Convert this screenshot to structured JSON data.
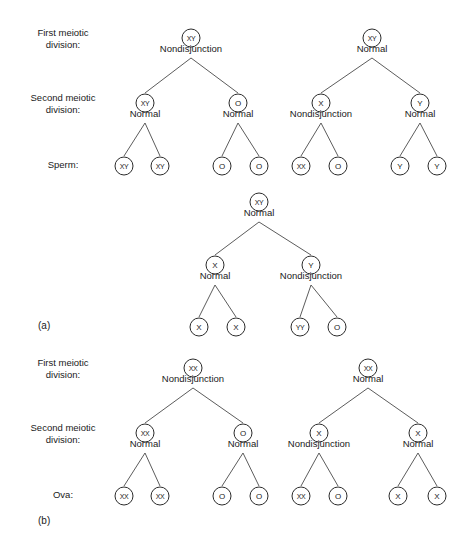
{
  "figure": {
    "background_color": "#ffffff",
    "stroke_color": "#2b2b2b",
    "line_color": "#4a4a4a",
    "text_color": "#1a1a1a",
    "width": 470,
    "height": 557
  },
  "panels": [
    {
      "id": "panel-a",
      "caption": "(a)",
      "caption_x": 38,
      "caption_y": 329,
      "row_labels": [
        {
          "id": "row-label-first-meiotic-a",
          "line1": "First meiotic",
          "line2": "division:",
          "x": 63,
          "y": 36
        },
        {
          "id": "row-label-second-meiotic-a",
          "line1": "Second meiotic",
          "line2": "division:",
          "x": 63,
          "y": 101
        },
        {
          "id": "row-label-gamete-a",
          "line1": "Sperm:",
          "line2": "",
          "x": 63,
          "y": 168
        }
      ],
      "trees": [
        {
          "id": "tree-a-left",
          "root": {
            "id": "node-a-left-root",
            "genotype": "XY",
            "event": "Nondisjunction",
            "x": 191,
            "y": 38,
            "children": [
              {
                "id": "node-a-left-sec-1",
                "genotype": "XY",
                "event": "Normal",
                "x": 145,
                "y": 103,
                "children": [
                  {
                    "id": "node-a-left-sperm-1",
                    "genotype": "XY",
                    "event": "",
                    "x": 124,
                    "y": 166,
                    "children": []
                  },
                  {
                    "id": "node-a-left-sperm-2",
                    "genotype": "XY",
                    "event": "",
                    "x": 160,
                    "y": 166,
                    "children": []
                  }
                ]
              },
              {
                "id": "node-a-left-sec-2",
                "genotype": "O",
                "event": "Normal",
                "x": 238,
                "y": 103,
                "children": [
                  {
                    "id": "node-a-left-sperm-3",
                    "genotype": "O",
                    "event": "",
                    "x": 222,
                    "y": 166,
                    "children": []
                  },
                  {
                    "id": "node-a-left-sperm-4",
                    "genotype": "O",
                    "event": "",
                    "x": 259,
                    "y": 166,
                    "children": []
                  }
                ]
              }
            ]
          }
        },
        {
          "id": "tree-a-right",
          "root": {
            "id": "node-a-right-root",
            "genotype": "XY",
            "event": "Normal",
            "x": 372,
            "y": 38,
            "children": [
              {
                "id": "node-a-right-sec-1",
                "genotype": "X",
                "event": "Nondisjunction",
                "x": 321,
                "y": 103,
                "children": [
                  {
                    "id": "node-a-right-sperm-1",
                    "genotype": "XX",
                    "event": "",
                    "x": 301,
                    "y": 166,
                    "children": []
                  },
                  {
                    "id": "node-a-right-sperm-2",
                    "genotype": "O",
                    "event": "",
                    "x": 338,
                    "y": 166,
                    "children": []
                  }
                ]
              },
              {
                "id": "node-a-right-sec-2",
                "genotype": "Y",
                "event": "Normal",
                "x": 420,
                "y": 103,
                "children": [
                  {
                    "id": "node-a-right-sperm-3",
                    "genotype": "Y",
                    "event": "",
                    "x": 400,
                    "y": 166,
                    "children": []
                  },
                  {
                    "id": "node-a-right-sperm-4",
                    "genotype": "Y",
                    "event": "",
                    "x": 437,
                    "y": 166,
                    "children": []
                  }
                ]
              }
            ]
          }
        },
        {
          "id": "tree-a-middle",
          "root": {
            "id": "node-a-mid-root",
            "genotype": "XY",
            "event": "Normal",
            "x": 259,
            "y": 202,
            "children": [
              {
                "id": "node-a-mid-sec-1",
                "genotype": "X",
                "event": "Normal",
                "x": 215,
                "y": 265,
                "children": [
                  {
                    "id": "node-a-mid-sperm-1",
                    "genotype": "X",
                    "event": "",
                    "x": 199,
                    "y": 327,
                    "children": []
                  },
                  {
                    "id": "node-a-mid-sperm-2",
                    "genotype": "X",
                    "event": "",
                    "x": 236,
                    "y": 327,
                    "children": []
                  }
                ]
              },
              {
                "id": "node-a-mid-sec-2",
                "genotype": "Y",
                "event": "Nondisjunction",
                "x": 311,
                "y": 265,
                "children": [
                  {
                    "id": "node-a-mid-sperm-3",
                    "genotype": "YY",
                    "event": "",
                    "x": 300,
                    "y": 327,
                    "children": []
                  },
                  {
                    "id": "node-a-mid-sperm-4",
                    "genotype": "O",
                    "event": "",
                    "x": 337,
                    "y": 327,
                    "children": []
                  }
                ]
              }
            ]
          }
        }
      ]
    },
    {
      "id": "panel-b",
      "caption": "(b)",
      "caption_x": 38,
      "caption_y": 524,
      "row_labels": [
        {
          "id": "row-label-first-meiotic-b",
          "line1": "First meiotic",
          "line2": "division:",
          "x": 63,
          "y": 366
        },
        {
          "id": "row-label-second-meiotic-b",
          "line1": "Second meiotic",
          "line2": "division:",
          "x": 63,
          "y": 431
        },
        {
          "id": "row-label-gamete-b",
          "line1": "Ova:",
          "line2": "",
          "x": 63,
          "y": 498
        }
      ],
      "trees": [
        {
          "id": "tree-b-left",
          "root": {
            "id": "node-b-left-root",
            "genotype": "XX",
            "event": "Nondisjunction",
            "x": 193,
            "y": 368,
            "children": [
              {
                "id": "node-b-left-sec-1",
                "genotype": "XX",
                "event": "Normal",
                "x": 145,
                "y": 433,
                "children": [
                  {
                    "id": "node-b-left-ova-1",
                    "genotype": "XX",
                    "event": "",
                    "x": 124,
                    "y": 496,
                    "children": []
                  },
                  {
                    "id": "node-b-left-ova-2",
                    "genotype": "XX",
                    "event": "",
                    "x": 160,
                    "y": 496,
                    "children": []
                  }
                ]
              },
              {
                "id": "node-b-left-sec-2",
                "genotype": "O",
                "event": "Normal",
                "x": 243,
                "y": 433,
                "children": [
                  {
                    "id": "node-b-left-ova-3",
                    "genotype": "O",
                    "event": "",
                    "x": 222,
                    "y": 496,
                    "children": []
                  },
                  {
                    "id": "node-b-left-ova-4",
                    "genotype": "O",
                    "event": "",
                    "x": 259,
                    "y": 496,
                    "children": []
                  }
                ]
              }
            ]
          }
        },
        {
          "id": "tree-b-right",
          "root": {
            "id": "node-b-right-root",
            "genotype": "XX",
            "event": "Normal",
            "x": 368,
            "y": 368,
            "children": [
              {
                "id": "node-b-right-sec-1",
                "genotype": "X",
                "event": "Nondisjunction",
                "x": 319,
                "y": 433,
                "children": [
                  {
                    "id": "node-b-right-ova-1",
                    "genotype": "XX",
                    "event": "",
                    "x": 301,
                    "y": 496,
                    "children": []
                  },
                  {
                    "id": "node-b-right-ova-2",
                    "genotype": "O",
                    "event": "",
                    "x": 338,
                    "y": 496,
                    "children": []
                  }
                ]
              },
              {
                "id": "node-b-right-sec-2",
                "genotype": "X",
                "event": "Normal",
                "x": 418,
                "y": 433,
                "children": [
                  {
                    "id": "node-b-right-ova-3",
                    "genotype": "X",
                    "event": "",
                    "x": 398,
                    "y": 496,
                    "children": []
                  },
                  {
                    "id": "node-b-right-ova-4",
                    "genotype": "X",
                    "event": "",
                    "x": 437,
                    "y": 496,
                    "children": []
                  }
                ]
              }
            ]
          }
        }
      ]
    }
  ]
}
